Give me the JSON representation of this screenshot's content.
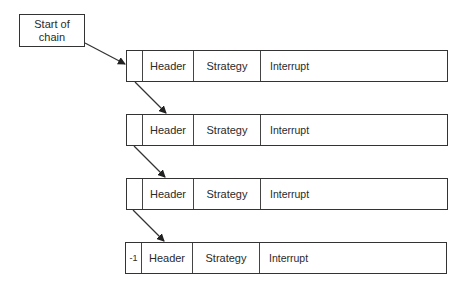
{
  "diagram": {
    "start": {
      "label_line1": "Start of",
      "label_line2": "chain"
    },
    "records": [
      {
        "pointer": "",
        "header": "Header",
        "strategy": "Strategy",
        "interrupt": "Interrupt"
      },
      {
        "pointer": "",
        "header": "Header",
        "strategy": "Strategy",
        "interrupt": "Interrupt"
      },
      {
        "pointer": "",
        "header": "Header",
        "strategy": "Strategy",
        "interrupt": "Interrupt"
      },
      {
        "pointer": "-1",
        "header": "Header",
        "strategy": "Strategy",
        "interrupt": "Interrupt"
      }
    ],
    "colors": {
      "line": "#333333",
      "background": "#ffffff"
    }
  }
}
